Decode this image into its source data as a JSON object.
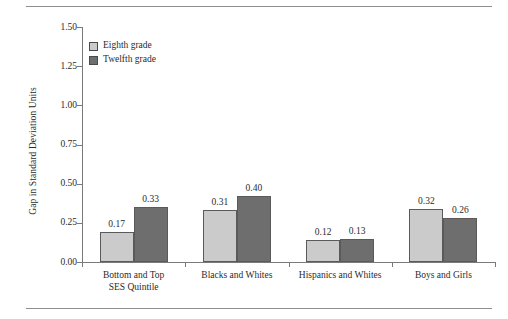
{
  "chart_data": {
    "type": "bar",
    "title": "",
    "xlabel": "",
    "ylabel": "Gap in Standard Deviation Units",
    "ylim": [
      0.0,
      1.5
    ],
    "ytick_labels": [
      "0.00",
      "0.25",
      "0.50",
      "0.75",
      "1.00",
      "1.25",
      "1.50"
    ],
    "ytick_values": [
      0.0,
      0.25,
      0.5,
      0.75,
      1.0,
      1.25,
      1.5
    ],
    "grid": false,
    "legend_position": "upper-left-inside",
    "categories": [
      "Bottom and Top\nSES Quintile",
      "Blacks and Whites",
      "Hispanics and Whites",
      "Boys and Girls"
    ],
    "series": [
      {
        "name": "Eighth grade",
        "color": "#cbcbcb",
        "values": [
          0.17,
          0.31,
          0.12,
          0.32
        ],
        "labels": [
          "0.17",
          "0.31",
          "0.12",
          "0.32"
        ],
        "plotted_heights": [
          0.19,
          0.33,
          0.14,
          0.34
        ]
      },
      {
        "name": "Twelfth grade",
        "color": "#6e6e6e",
        "values": [
          0.33,
          0.4,
          0.13,
          0.26
        ],
        "labels": [
          "0.33",
          "0.40",
          "0.13",
          "0.26"
        ],
        "plotted_heights": [
          0.35,
          0.42,
          0.15,
          0.28
        ]
      }
    ]
  },
  "legend": {
    "items": [
      {
        "label": "Eighth grade",
        "swatch": "light"
      },
      {
        "label": "Twelfth grade",
        "swatch": "dark"
      }
    ]
  },
  "colors": {
    "eighth_grade": "#cbcbcb",
    "twelfth_grade": "#6e6e6e",
    "axis": "#7a7a7a",
    "rule": "#8e8e8e",
    "text": "#2b2b2b"
  }
}
